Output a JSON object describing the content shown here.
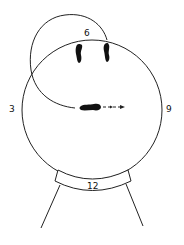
{
  "diagram": {
    "labels": {
      "top": "6",
      "left": "3",
      "right": "9",
      "bottom": "12"
    },
    "colors": {
      "stroke": "#222222",
      "fill": "#111111",
      "background": "#ffffff"
    }
  }
}
